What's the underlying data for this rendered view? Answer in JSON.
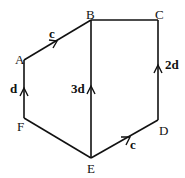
{
  "diagram": {
    "type": "vector-hexagon",
    "points": {
      "A": {
        "label": "A",
        "x": 24,
        "y": 60
      },
      "B": {
        "label": "B",
        "x": 91,
        "y": 20
      },
      "C": {
        "label": "C",
        "x": 158,
        "y": 20
      },
      "D": {
        "label": "D",
        "x": 158,
        "y": 120
      },
      "E": {
        "label": "E",
        "x": 91,
        "y": 158
      },
      "F": {
        "label": "F",
        "x": 24,
        "y": 118
      }
    },
    "edges": [
      {
        "from": "A",
        "to": "B",
        "vector": "c"
      },
      {
        "from": "B",
        "to": "C",
        "vector": ""
      },
      {
        "from": "D",
        "to": "C",
        "vector": "2d"
      },
      {
        "from": "E",
        "to": "D",
        "vector": "c"
      },
      {
        "from": "F",
        "to": "E",
        "vector": ""
      },
      {
        "from": "F",
        "to": "A",
        "vector": "d"
      },
      {
        "from": "E",
        "to": "B",
        "vector": "3d"
      }
    ],
    "vector_labels": {
      "AB": "c",
      "FA": "d",
      "EB": "3d",
      "DC": "2d",
      "ED": "c"
    }
  }
}
